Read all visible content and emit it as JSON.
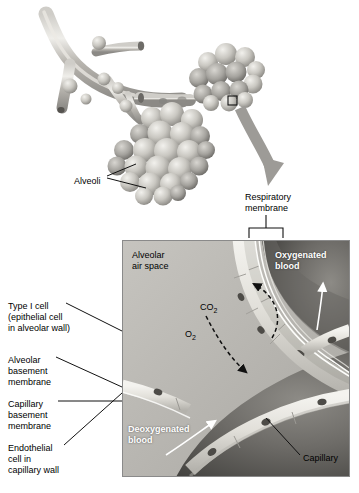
{
  "figure": {
    "background_color": "#ffffff"
  },
  "upper_illustration": {
    "name": "bronchiole-alveoli-artwork",
    "labels": [
      {
        "id": "alveoli",
        "text": "Alveoli",
        "x": 74,
        "y": 176
      }
    ],
    "callout_box": {
      "x": 228,
      "y": 96,
      "w": 9,
      "h": 9
    },
    "zoom_arrow": {
      "description": "thick gray curved arrow from callout box down to detail panel"
    }
  },
  "bracket_label": {
    "name": "respiratory-membrane",
    "line1": "Respiratory",
    "line2": "membrane",
    "x": 245,
    "y": 192
  },
  "detail_panel": {
    "name": "respiratory-membrane-detail",
    "x": 122,
    "y": 240,
    "w": 228,
    "h": 237,
    "inner_labels": [
      {
        "id": "alveolar-air-space",
        "line1": "Alveolar",
        "line2": "air space",
        "x": 132,
        "y": 250,
        "style": "dark"
      },
      {
        "id": "oxygenated-blood",
        "line1": "Oxygenated",
        "line2": "blood",
        "x": 275,
        "y": 250,
        "style": "white-bold"
      },
      {
        "id": "deoxygenated-blood",
        "line1": "Deoxygenated",
        "line2": "blood",
        "x": 128,
        "y": 424,
        "style": "white-bold"
      },
      {
        "id": "capillary",
        "line1": "Capillary",
        "x": 303,
        "y": 453,
        "style": "dark"
      }
    ],
    "gas_labels": [
      {
        "id": "carbon-dioxide",
        "text": "CO",
        "sub": "2",
        "x": 190,
        "y": 291
      },
      {
        "id": "oxygen",
        "text": "O",
        "sub": "2",
        "x": 175,
        "y": 318
      }
    ]
  },
  "left_labels": [
    {
      "id": "type-i-cell",
      "lines": [
        "Type I cell",
        "(epithelial cell",
        "in alveolar wall)"
      ],
      "x": 8,
      "y": 301
    },
    {
      "id": "alveolar-basement-membrane",
      "lines": [
        "Alveolar",
        "basement",
        "membrane"
      ],
      "x": 8,
      "y": 355
    },
    {
      "id": "capillary-basement-membrane",
      "lines": [
        "Capillary",
        "basement",
        "membrane"
      ],
      "x": 8,
      "y": 399
    },
    {
      "id": "endothelial-cell",
      "lines": [
        "Endothelial",
        "cell in",
        "capillary wall"
      ],
      "x": 8,
      "y": 443
    }
  ],
  "colors": {
    "panel_border": "#8a8a8a",
    "air_space": "#b9b9b9",
    "blood_dark": "#5a5a5a",
    "cell_light": "#e4e2dc",
    "nucleus": "#4a4a4a",
    "leader_line": "#000000",
    "arrow_gray": "#9a9a9a"
  }
}
